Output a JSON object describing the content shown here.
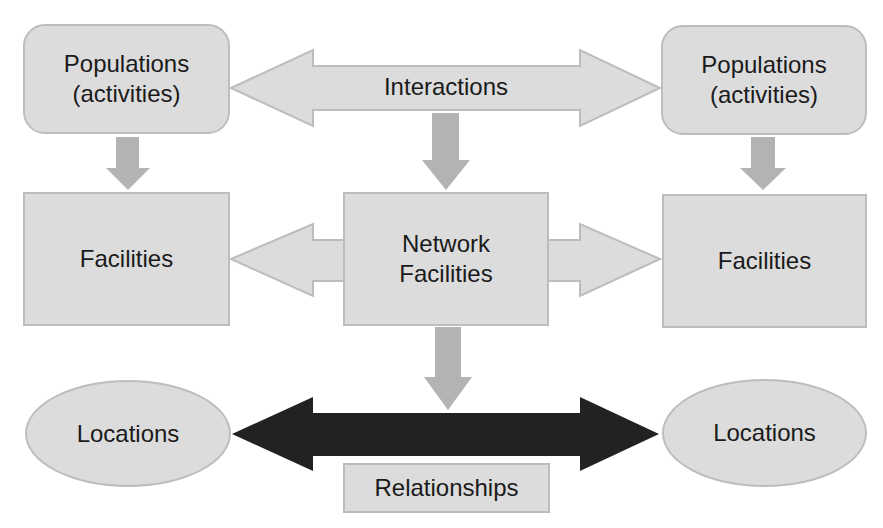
{
  "diagram": {
    "title": "",
    "colors": {
      "fill": "#dcdcdc",
      "border": "#bdbdbd",
      "down_arrow": "#b3b3b3",
      "relationship_arrow": "#222222",
      "text": "#1a1a1a"
    },
    "nodes": {
      "populations_left": {
        "line1": "Populations",
        "line2": "(activities)"
      },
      "populations_right": {
        "line1": "Populations",
        "line2": "(activities)"
      },
      "facilities_left": {
        "label": "Facilities"
      },
      "network_facilities": {
        "line1": "Network",
        "line2": "Facilities"
      },
      "facilities_right": {
        "label": "Facilities"
      },
      "locations_left": {
        "label": "Locations"
      },
      "locations_right": {
        "label": "Locations"
      },
      "relationships": {
        "label": "Relationships"
      }
    },
    "arrows": {
      "interactions": {
        "label": "Interactions",
        "type": "double-headed",
        "from": "populations_left",
        "to": "populations_right"
      },
      "network_to_facilities": {
        "type": "double-headed",
        "from": "facilities_left",
        "to": "facilities_right",
        "via": "network_facilities"
      },
      "relationships_arrow": {
        "type": "double-headed",
        "from": "locations_left",
        "to": "locations_right"
      },
      "down_arrows": [
        {
          "from": "populations_left",
          "to": "facilities_left"
        },
        {
          "from": "interactions",
          "to": "network_facilities"
        },
        {
          "from": "populations_right",
          "to": "facilities_right"
        },
        {
          "from": "network_facilities",
          "to": "relationships_arrow"
        }
      ]
    }
  }
}
